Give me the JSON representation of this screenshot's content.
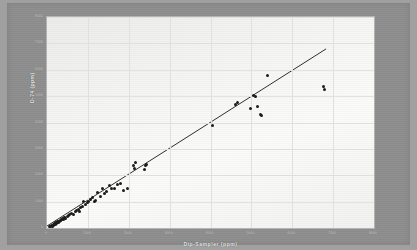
{
  "figure": {
    "background_color": "#8e8e8e",
    "page_color": "#a0a0a0",
    "plot_background_color": "#f6f6f5",
    "point_color": "#1a1a1a",
    "line_color": "#141414",
    "grid_color": "#e2e2e0",
    "label_color": "#dcdcdc"
  },
  "chart_data": {
    "type": "scatter",
    "title": "",
    "xlabel": "Dip-Sampler  (ppm)",
    "ylabel": "D-74 (ppm)",
    "xlim": [
      0,
      8000
    ],
    "ylim": [
      0,
      8000
    ],
    "grid": true,
    "legend": "none",
    "xticks": [
      0,
      1000,
      2000,
      3000,
      4000,
      5000,
      6000,
      7000,
      8000
    ],
    "xticklabels": [
      "0",
      "1000",
      "2000",
      "3000",
      "4000",
      "5000",
      "6000",
      "7000",
      "8000"
    ],
    "yticks": [
      0,
      1000,
      2000,
      3000,
      4000,
      5000,
      6000,
      7000,
      8000
    ],
    "yticklabels": [
      "0",
      "1000",
      "2000",
      "3000",
      "4000",
      "5000",
      "6000",
      "7000",
      "8000"
    ],
    "series": [
      {
        "name": "Samples",
        "marker": "circle",
        "points": [
          [
            60,
            40
          ],
          [
            90,
            70
          ],
          [
            110,
            95
          ],
          [
            130,
            60
          ],
          [
            150,
            130
          ],
          [
            170,
            110
          ],
          [
            185,
            165
          ],
          [
            200,
            150
          ],
          [
            215,
            195
          ],
          [
            230,
            175
          ],
          [
            245,
            215
          ],
          [
            260,
            240
          ],
          [
            275,
            205
          ],
          [
            290,
            265
          ],
          [
            305,
            250
          ],
          [
            320,
            295
          ],
          [
            335,
            270
          ],
          [
            350,
            330
          ],
          [
            365,
            305
          ],
          [
            380,
            345
          ],
          [
            400,
            320
          ],
          [
            420,
            380
          ],
          [
            440,
            410
          ],
          [
            460,
            365
          ],
          [
            490,
            430
          ],
          [
            520,
            470
          ],
          [
            560,
            500
          ],
          [
            600,
            560
          ],
          [
            640,
            520
          ],
          [
            690,
            610
          ],
          [
            720,
            660
          ],
          [
            760,
            700
          ],
          [
            790,
            640
          ],
          [
            830,
            760
          ],
          [
            870,
            800
          ],
          [
            900,
            1020
          ],
          [
            940,
            880
          ],
          [
            980,
            960
          ],
          [
            1020,
            1010
          ],
          [
            1060,
            1070
          ],
          [
            1110,
            1140
          ],
          [
            1150,
            1020
          ],
          [
            1190,
            1060
          ],
          [
            1240,
            1330
          ],
          [
            1300,
            1200
          ],
          [
            1350,
            1500
          ],
          [
            1400,
            1320
          ],
          [
            1460,
            1400
          ],
          [
            1520,
            1600
          ],
          [
            1590,
            1480
          ],
          [
            1650,
            1500
          ],
          [
            1720,
            1660
          ],
          [
            1800,
            1680
          ],
          [
            1880,
            1440
          ],
          [
            1960,
            1480
          ],
          [
            2120,
            2380
          ],
          [
            2140,
            2240
          ],
          [
            2170,
            2480
          ],
          [
            2380,
            2200
          ],
          [
            2420,
            2370
          ],
          [
            2440,
            2410
          ],
          [
            4040,
            3870
          ],
          [
            4620,
            4700
          ],
          [
            4660,
            4770
          ],
          [
            4980,
            4520
          ],
          [
            5060,
            5030
          ],
          [
            5100,
            4990
          ],
          [
            5140,
            4600
          ],
          [
            5220,
            4310
          ],
          [
            5240,
            4270
          ],
          [
            5400,
            5770
          ],
          [
            6760,
            5370
          ],
          [
            6800,
            5260
          ]
        ]
      }
    ],
    "fit_line": {
      "name": "Regression line",
      "x_start": 0,
      "y_start": 0,
      "x_end": 6870,
      "y_end": 6780
    }
  }
}
